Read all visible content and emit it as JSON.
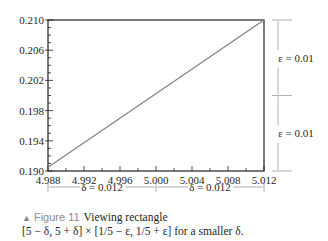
{
  "chart_data": {
    "type": "line",
    "title": "",
    "xlabel": "",
    "ylabel": "",
    "xlim": [
      4.988,
      5.012
    ],
    "ylim": [
      0.19,
      0.21
    ],
    "grid": false,
    "x_ticks": [
      "4.988",
      "4.992",
      "4.996",
      "5.000",
      "5.004",
      "5.008",
      "5.012"
    ],
    "y_ticks": [
      "0.190",
      "0.194",
      "0.198",
      "0.202",
      "0.206",
      "0.210"
    ],
    "series": [
      {
        "name": "f(x)",
        "x": [
          4.988,
          5.012
        ],
        "y": [
          0.1905,
          0.21
        ]
      }
    ],
    "annotations": {
      "delta_left": "δ = 0.012",
      "delta_right": "δ = 0.012",
      "epsilon_top": "ε = 0.01",
      "epsilon_bottom": "ε = 0.01"
    }
  },
  "caption": {
    "marker": "▲",
    "figure_label": "Figure 11",
    "title": "Viewing rectangle",
    "line2": "[5 − δ, 5 + δ] × [1/5 − ε, 1/5 + ε] for a smaller δ."
  },
  "colors": {
    "frame": "#231f20",
    "line": "#808080",
    "annotation": "#9a9a9a",
    "caption_label": "#8a8a8a"
  }
}
